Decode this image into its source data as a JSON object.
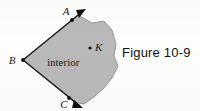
{
  "figure": {
    "caption": "Figure 10-9",
    "region_label": "interior",
    "background_color": "#fdfdfc",
    "region_fill_color": "#b9b9b9",
    "region_stroke_color": "#7e7e7e",
    "ray_color": "#1a1a1a",
    "vertices": [
      {
        "name": "A",
        "label": "A",
        "x": 72,
        "y": 20,
        "label_x": 66,
        "label_y": 15
      },
      {
        "name": "B",
        "label": "B",
        "x": 23,
        "y": 60,
        "label_x": 11,
        "label_y": 60
      },
      {
        "name": "C",
        "label": "C",
        "x": 69,
        "y": 98,
        "label_x": 63,
        "label_y": 106
      }
    ],
    "interior_point": {
      "name": "K",
      "label": "K",
      "x": 90,
      "y": 48,
      "label_x": 95,
      "label_y": 48
    },
    "rays": [
      {
        "name": "ray-BA",
        "from": "B",
        "through": "A",
        "tip_x": 86,
        "tip_y": 9
      },
      {
        "name": "ray-BC",
        "from": "B",
        "through": "C",
        "tip_x": 83,
        "tip_y": 108
      }
    ],
    "interior_label_position": {
      "x": 47,
      "y": 63
    }
  }
}
